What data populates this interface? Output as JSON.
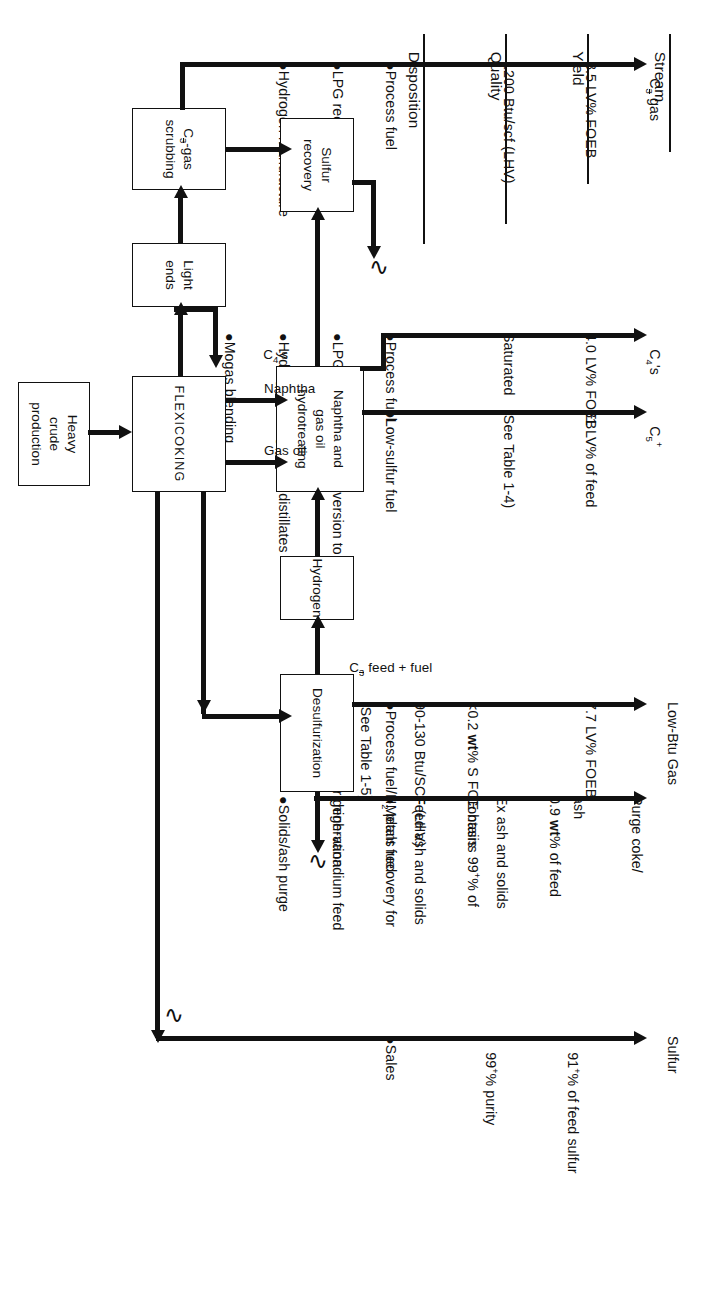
{
  "figure": {
    "kind": "process-flow-diagram",
    "orientation": "landscape, rotated 90 degrees in screenshot"
  },
  "columns": {
    "stream": "Stream",
    "yield": "Yield",
    "quality": "Quality",
    "disposition": "Disposition"
  },
  "rows": [
    {
      "stream_main": "C",
      "stream_sub": "3",
      "stream_sup": "",
      "stream_tail": " gas",
      "stream_plain": "C3- gas",
      "yield": "8.5 LV% FOEB",
      "quality": [
        "1200 Btu/scf (LHV)"
      ],
      "disposition": [
        "Process fuel",
        "LPG recovery",
        "Hydrogen manufacture"
      ]
    },
    {
      "stream_plain": "C4's",
      "yield": "4.0 LV% FOEB",
      "quality": [
        "Saturated"
      ],
      "disposition": [
        "Process fuel",
        "LPG",
        "Hydrogen manufacture",
        "Mogas blending"
      ]
    },
    {
      "stream_plain": "C5+",
      "yield": "81 LV% of feed",
      "quality": [
        "(See Table 1-4)"
      ],
      "disposition": [
        "Low-sulfur fuel",
        "Further conversion to",
        "  mogas and distillates"
      ]
    },
    {
      "stream_plain": "Low-Btu Gas",
      "yield": "7.7 LV% FOEB",
      "quality": [
        "<0.2 wt% S FOE basis",
        "90-130 Btu/SCF (LHV)",
        "(See Table 1-5)"
      ],
      "disposition": [
        "Process fuel/H2 plant fuel",
        "Steam power generation"
      ]
    },
    {
      "stream_plain": "Purge coke/ ash",
      "yield": "0.9 wt% of feed Ex ash and solids",
      "quality": [
        "Contains 99+% of",
        "Feed ash and solids"
      ],
      "disposition": [
        "Metals recovery for",
        "  high-vanadium feed",
        "Solids/ash purge"
      ]
    },
    {
      "stream_plain": "Sulfur",
      "yield": "91+% of feed sulfur",
      "quality": [
        "99+% purity"
      ],
      "disposition": [
        "Sales"
      ]
    }
  ],
  "stream_labels": {
    "c3_gas": " gas",
    "c3_base": "C",
    "c3_idx": "3",
    "c4s": "C",
    "c4s_idx": "4",
    "c4s_tail": "'s",
    "c5p": "C",
    "c5p_idx": "5",
    "c5p_sup": "+",
    "low_btu_gas": "Low-Btu Gas",
    "purge_coke": "Purge coke/",
    "purge_ash": "ash",
    "sulfur": "Sulfur"
  },
  "yields": {
    "r1": "8.5 LV% FOEB",
    "r2": "4.0 LV% FOEB",
    "r3": "81 LV% of feed",
    "r4": "7.7 LV% FOEB",
    "r5a": "0.9 ",
    "r5b": "wt",
    "r5c": "% of feed",
    "r5d": "Ex ash and solids",
    "r6a": "91",
    "r6b": "+",
    "r6c": "% of feed sulfur"
  },
  "quality": {
    "r1": "1200 Btu/scf (LHV)",
    "r2": "Saturated",
    "r3": "(See Table 1-4)",
    "r4a": "<0.2 ",
    "r4b": "wt",
    "r4c": "% S FOE basis",
    "r4d": "90-130 Btu/SCF (LHV)",
    "r4e": "(See Table 1-5)",
    "r5a": "Contains 99",
    "r5b": "+",
    "r5c": "% of",
    "r5d": "Feed ash and solids",
    "r6a": "99",
    "r6b": "+",
    "r6c": "% purity"
  },
  "disposition": {
    "r1": [
      "●Process fuel",
      "●LPG recovery",
      "●Hydrogen manufacture"
    ],
    "r1a": "●Process fuel",
    "r1b": "●LPG recovery",
    "r1c": "●Hydrogen manufacture",
    "r2a": "●Process fuel",
    "r2b": "●LPG",
    "r2c": "●Hydrogen manufacture",
    "r2d": "●Mogas blending",
    "r3a": "●Low-sulfur fuel",
    "r3b": "●Further conversion to",
    "r3c": "  mogas and distillates",
    "r4a1": "●Process fuel/H",
    "r4a2": "2",
    "r4a3": " plant fuel",
    "r4b": "●Steam power generation",
    "r5a": "●Metals recovery for",
    "r5b": "  high-vanadium feed",
    "r5c": "●Solids/ash purge",
    "r6a": "●Sales"
  },
  "boxes": {
    "heavy_crude": "Heavy\ncrude\nproduction",
    "flexicoking": "FLEXICOKING",
    "light_ends": "Light ends",
    "c3_gas_scrubbing_l1": "C",
    "c3_gas_scrubbing_idx": "3",
    "c3_gas_scrubbing_l2": "-gas",
    "c3_gas_scrubbing_l3": "scrubbing",
    "sulfur_recovery": "Sulfur\nrecovery",
    "naphtha_hydrotreating": "Naphtha and\ngas oil\nhydrotreating",
    "hydrogen": "Hydrogen",
    "desulfurization": "Desulfurization"
  },
  "flow_labels": {
    "c4s": "C",
    "c4s_idx": "4",
    "c4s_tail": "'s",
    "naphtha": "Naphtha",
    "gas_oil": "Gas oil",
    "c3_feed_base": "C",
    "c3_feed_idx": "3",
    "c3_feed_tail": " feed + fuel"
  },
  "colors": {
    "ink": "#111111",
    "paper": "#ffffff"
  }
}
